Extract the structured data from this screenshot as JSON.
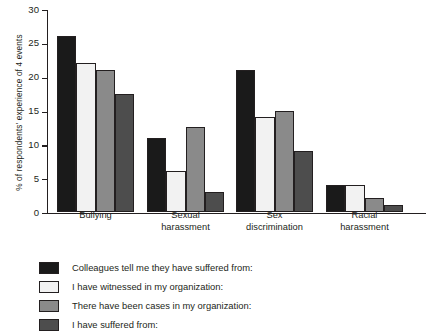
{
  "chart_data": {
    "type": "bar",
    "title": "",
    "xlabel": "",
    "ylabel": "% of respondents' experience of 4 events",
    "ylim": [
      0,
      30
    ],
    "yticks": [
      0,
      5,
      10,
      15,
      20,
      25,
      30
    ],
    "grid": false,
    "legend_position": "bottom-left",
    "categories": [
      "Bullying",
      "Sexual harassment",
      "Sex discrimination",
      "Racial harassment"
    ],
    "category_lines": [
      [
        "Bullying"
      ],
      [
        "Sexual",
        "harassment"
      ],
      [
        "Sex",
        "discrimination"
      ],
      [
        "Racial",
        "harassment"
      ]
    ],
    "series": [
      {
        "name": "Colleagues tell me they have suffered from:",
        "color": "#1a1a1a",
        "values": [
          26,
          11,
          21,
          4
        ]
      },
      {
        "name": "I have witnessed in my organization:",
        "color": "#f2f2f2",
        "values": [
          22,
          6,
          14,
          4
        ]
      },
      {
        "name": "There have been cases in my organization:",
        "color": "#8a8a8a",
        "values": [
          21,
          12.5,
          15,
          2
        ]
      },
      {
        "name": "I have suffered from:",
        "color": "#4d4d4d",
        "values": [
          17.5,
          3,
          9,
          1
        ]
      }
    ]
  },
  "axis": {
    "tick_labels": [
      "0",
      "5",
      "10",
      "15",
      "20",
      "25",
      "30"
    ]
  },
  "legend": {
    "items": [
      {
        "label": "Colleagues tell me they have suffered from:",
        "color": "#1a1a1a"
      },
      {
        "label": "I have witnessed in my organization:",
        "color": "#f2f2f2"
      },
      {
        "label": "There have been cases in my organization:",
        "color": "#8a8a8a"
      },
      {
        "label": "I have suffered from:",
        "color": "#4d4d4d"
      }
    ]
  }
}
